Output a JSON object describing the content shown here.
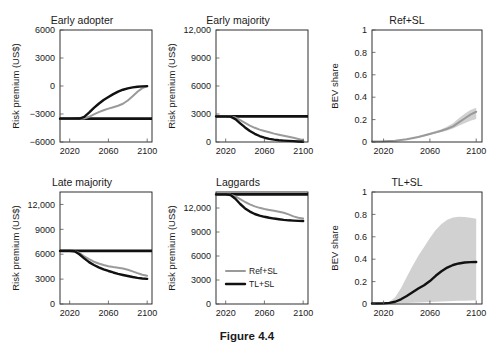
{
  "figure": {
    "caption": "Figure 4.4",
    "width": 494,
    "height": 350
  },
  "style": {
    "ref_color": "#9a9a9a",
    "tl_color": "#111111",
    "band_color": "#c9c9c9",
    "axis_color": "#1a1a1a"
  },
  "legend": {
    "position": "laggards-panel-left",
    "entries": [
      {
        "label": "Ref+SL",
        "color": "#9a9a9a",
        "style": "thin-gray-line"
      },
      {
        "label": "TL+SL",
        "color": "#111111",
        "style": "thick-black-line"
      }
    ]
  },
  "axis_titles": {
    "risk_premium": "Risk premium (US$)",
    "bev_share": "BEV share"
  },
  "chart_data": [
    {
      "id": "early-adopter",
      "type": "line",
      "title": "Early adopter",
      "xlabel": "",
      "ylabel": "Risk premium (US$)",
      "xlim": [
        2010,
        2105
      ],
      "ylim": [
        -6000,
        6000
      ],
      "xticks": [
        2020,
        2060,
        2100
      ],
      "xticklabels": [
        "2020",
        "2060",
        "2100"
      ],
      "yticks": [
        -6000,
        -3000,
        0,
        3000,
        6000
      ],
      "yticklabels": [
        "−6000",
        "−3000",
        "0",
        "3000",
        "6000"
      ],
      "grid": false,
      "x": [
        2010,
        2020,
        2030,
        2035,
        2040,
        2045,
        2050,
        2055,
        2060,
        2065,
        2070,
        2075,
        2080,
        2085,
        2090,
        2095,
        2100
      ],
      "baseline": {
        "name": "Reference baseline",
        "value": -3500,
        "color": "#111111"
      },
      "series": [
        {
          "name": "Ref+SL",
          "color": "#9a9a9a",
          "values": [
            -3500,
            -3500,
            -3500,
            -3480,
            -3300,
            -3050,
            -2800,
            -2600,
            -2420,
            -2270,
            -2120,
            -1900,
            -1550,
            -1100,
            -620,
            -230,
            -40
          ]
        },
        {
          "name": "TL+SL",
          "color": "#111111",
          "values": [
            -3500,
            -3500,
            -3490,
            -3300,
            -2850,
            -2350,
            -1900,
            -1500,
            -1180,
            -870,
            -600,
            -400,
            -250,
            -150,
            -80,
            -35,
            -10
          ]
        }
      ]
    },
    {
      "id": "early-majority",
      "type": "line",
      "title": "Early majority",
      "xlabel": "",
      "ylabel": "Risk premium (US$)",
      "xlim": [
        2010,
        2105
      ],
      "ylim": [
        0,
        12000
      ],
      "xticks": [
        2020,
        2060,
        2100
      ],
      "xticklabels": [
        "2020",
        "2060",
        "2100"
      ],
      "yticks": [
        0,
        3000,
        6000,
        9000,
        12000
      ],
      "yticklabels": [
        "0",
        "3000",
        "6000",
        "9000",
        "12,000"
      ],
      "grid": false,
      "x": [
        2010,
        2020,
        2025,
        2030,
        2035,
        2040,
        2045,
        2050,
        2055,
        2060,
        2065,
        2070,
        2075,
        2080,
        2085,
        2090,
        2095,
        2100
      ],
      "baseline": {
        "name": "Reference baseline",
        "value": 2750,
        "color": "#111111"
      },
      "series": [
        {
          "name": "Ref+SL",
          "color": "#9a9a9a",
          "values": [
            2750,
            2750,
            2740,
            2620,
            2350,
            2050,
            1760,
            1520,
            1330,
            1180,
            1040,
            900,
            780,
            670,
            560,
            450,
            330,
            180
          ]
        },
        {
          "name": "TL+SL",
          "color": "#111111",
          "values": [
            2750,
            2750,
            2720,
            2450,
            2000,
            1560,
            1180,
            880,
            640,
            460,
            340,
            250,
            190,
            150,
            120,
            90,
            60,
            30
          ]
        }
      ]
    },
    {
      "id": "ref-sl-share",
      "type": "area",
      "title": "Ref+SL",
      "xlabel": "",
      "ylabel": "BEV share",
      "xlim": [
        2010,
        2105
      ],
      "ylim": [
        0,
        1
      ],
      "xticks": [
        2020,
        2060,
        2100
      ],
      "xticklabels": [
        "2020",
        "2060",
        "2100"
      ],
      "yticks": [
        0,
        0.2,
        0.4,
        0.6,
        0.8,
        1
      ],
      "yticklabels": [
        "0",
        "0.2",
        "0.4",
        "0.6",
        "0.8",
        "1"
      ],
      "grid": false,
      "x": [
        2010,
        2020,
        2030,
        2040,
        2050,
        2060,
        2065,
        2070,
        2075,
        2080,
        2085,
        2090,
        2095,
        2100
      ],
      "series": [
        {
          "name": "Ref+SL",
          "color": "#9a9a9a",
          "values": [
            0.004,
            0.006,
            0.012,
            0.025,
            0.045,
            0.072,
            0.086,
            0.1,
            0.118,
            0.14,
            0.175,
            0.21,
            0.245,
            0.27
          ]
        }
      ],
      "band": {
        "name": "uncertainty range",
        "color": "#c9c9c9",
        "lower": [
          0.004,
          0.005,
          0.01,
          0.021,
          0.039,
          0.064,
          0.077,
          0.09,
          0.103,
          0.12,
          0.145,
          0.168,
          0.19,
          0.205
        ],
        "upper": [
          0.004,
          0.007,
          0.014,
          0.029,
          0.052,
          0.082,
          0.098,
          0.114,
          0.138,
          0.168,
          0.212,
          0.252,
          0.285,
          0.305
        ]
      }
    },
    {
      "id": "late-majority",
      "type": "line",
      "title": "Late majority",
      "xlabel": "",
      "ylabel": "Risk premium (US$)",
      "xlim": [
        2010,
        2105
      ],
      "ylim": [
        0,
        13500
      ],
      "xticks": [
        2020,
        2060,
        2100
      ],
      "xticklabels": [
        "2020",
        "2060",
        "2100"
      ],
      "yticks": [
        0,
        3000,
        6000,
        9000,
        12000
      ],
      "yticklabels": [
        "0",
        "3000",
        "6000",
        "9000",
        "12,000"
      ],
      "grid": false,
      "x": [
        2010,
        2020,
        2025,
        2030,
        2035,
        2040,
        2045,
        2050,
        2055,
        2060,
        2065,
        2070,
        2075,
        2080,
        2085,
        2090,
        2095,
        2100
      ],
      "baseline": {
        "name": "Reference baseline",
        "value": 6400,
        "color": "#111111"
      },
      "series": [
        {
          "name": "Ref+SL",
          "color": "#9a9a9a",
          "values": [
            6400,
            6400,
            6380,
            6150,
            5750,
            5400,
            5100,
            4880,
            4700,
            4560,
            4450,
            4360,
            4270,
            4130,
            3930,
            3720,
            3530,
            3400
          ]
        },
        {
          "name": "TL+SL",
          "color": "#111111",
          "values": [
            6400,
            6400,
            6350,
            6000,
            5500,
            5050,
            4700,
            4420,
            4180,
            3980,
            3800,
            3640,
            3500,
            3370,
            3250,
            3150,
            3080,
            3030
          ]
        }
      ]
    },
    {
      "id": "laggards",
      "type": "line",
      "title": "Laggards",
      "xlabel": "",
      "ylabel": "Risk premium (US$)",
      "xlim": [
        2010,
        2105
      ],
      "ylim": [
        0,
        14000
      ],
      "xticks": [
        2020,
        2060,
        2100
      ],
      "xticklabels": [
        "2020",
        "2060",
        "2100"
      ],
      "yticks": [
        0,
        3000,
        6000,
        9000,
        12000
      ],
      "yticklabels": [
        "0",
        "3000",
        "6000",
        "9000",
        "12,000"
      ],
      "grid": false,
      "x": [
        2010,
        2020,
        2025,
        2030,
        2035,
        2040,
        2045,
        2050,
        2055,
        2060,
        2065,
        2070,
        2075,
        2080,
        2085,
        2090,
        2095,
        2100
      ],
      "baseline": {
        "name": "Reference baseline",
        "value": 13700,
        "color": "#111111"
      },
      "series": [
        {
          "name": "Ref+SL",
          "color": "#9a9a9a",
          "values": [
            13700,
            13700,
            13680,
            13450,
            13100,
            12750,
            12450,
            12200,
            12020,
            11880,
            11760,
            11650,
            11540,
            11400,
            11200,
            10950,
            10780,
            10700
          ]
        },
        {
          "name": "TL+SL",
          "color": "#111111",
          "values": [
            13700,
            13700,
            13620,
            13150,
            12500,
            11950,
            11550,
            11250,
            11050,
            10900,
            10780,
            10680,
            10600,
            10520,
            10460,
            10420,
            10390,
            10380
          ]
        }
      ]
    },
    {
      "id": "tl-sl-share",
      "type": "area",
      "title": "TL+SL",
      "xlabel": "",
      "ylabel": "BEV share",
      "xlim": [
        2010,
        2105
      ],
      "ylim": [
        0,
        1
      ],
      "xticks": [
        2020,
        2060,
        2100
      ],
      "xticklabels": [
        "2020",
        "2060",
        "2100"
      ],
      "yticks": [
        0,
        0.2,
        0.4,
        0.6,
        0.8,
        1
      ],
      "yticklabels": [
        "0",
        "0.2",
        "0.4",
        "0.6",
        "0.8",
        "1"
      ],
      "grid": false,
      "x": [
        2010,
        2020,
        2025,
        2030,
        2035,
        2040,
        2045,
        2050,
        2055,
        2060,
        2065,
        2070,
        2075,
        2080,
        2085,
        2090,
        2095,
        2100
      ],
      "series": [
        {
          "name": "TL+SL",
          "color": "#111111",
          "values": [
            0.004,
            0.006,
            0.01,
            0.02,
            0.042,
            0.072,
            0.105,
            0.138,
            0.168,
            0.205,
            0.252,
            0.292,
            0.325,
            0.348,
            0.362,
            0.37,
            0.374,
            0.375
          ]
        }
      ],
      "band": {
        "name": "uncertainty range",
        "color": "#c9c9c9",
        "lower": [
          0.004,
          0.004,
          0.005,
          0.006,
          0.008,
          0.01,
          0.012,
          0.014,
          0.016,
          0.018,
          0.02,
          0.022,
          0.024,
          0.026,
          0.028,
          0.03,
          0.032,
          0.034
        ],
        "upper": [
          0.004,
          0.008,
          0.02,
          0.06,
          0.14,
          0.24,
          0.34,
          0.43,
          0.51,
          0.59,
          0.66,
          0.715,
          0.752,
          0.772,
          0.778,
          0.776,
          0.77,
          0.762
        ]
      }
    }
  ]
}
